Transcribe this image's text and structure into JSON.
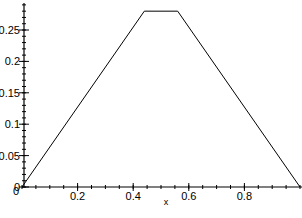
{
  "chart_data": {
    "type": "line",
    "title": "",
    "xlabel": "x",
    "ylabel": "",
    "xlim": [
      0,
      1
    ],
    "ylim": [
      0,
      0.29
    ],
    "x_ticks": [
      0.2,
      0.4,
      0.6,
      0.8
    ],
    "x_tick_labels": [
      "0.2",
      "0.4",
      "0.6",
      "0.8"
    ],
    "y_ticks": [
      0,
      0.05,
      0.1,
      0.15,
      0.2,
      0.25
    ],
    "y_tick_labels": [
      "0",
      "0.05",
      "0.1",
      "0.15",
      "0.2",
      "0.25"
    ],
    "grid": false,
    "legend": null,
    "series": [
      {
        "name": "f(x)",
        "x": [
          0,
          0.44,
          0.56,
          1.0
        ],
        "y": [
          0,
          0.28,
          0.28,
          0
        ]
      }
    ]
  }
}
